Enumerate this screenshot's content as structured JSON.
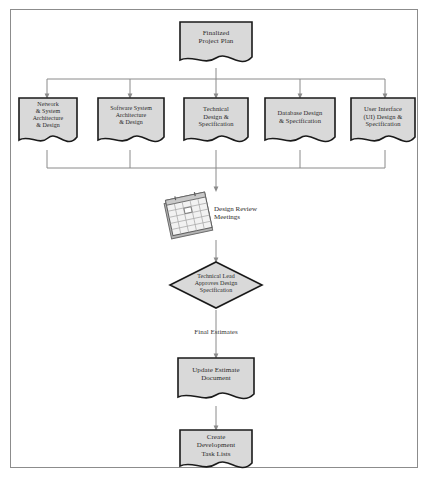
{
  "diagram": {
    "border_color": "#8c8c8c",
    "node_fill": "#d9d9d9",
    "node_stroke": "#1a1a1a",
    "connector_color": "#8a8a8a",
    "background": "#ffffff",
    "start_node": {
      "label": "Finalized\nProject Plan",
      "shape": "document"
    },
    "design_tasks": [
      {
        "label": "Network\n& System\nArchitecture\n& Design",
        "shape": "document"
      },
      {
        "label": "Software System\nArchitecture\n& Design",
        "shape": "document"
      },
      {
        "label": "Technical\nDesign &\nSpecification",
        "shape": "document"
      },
      {
        "label": "Database Design\n& Specification",
        "shape": "document"
      },
      {
        "label": "User Interface\n(UI) Design &\nSpecification",
        "shape": "document"
      }
    ],
    "meeting_node": {
      "label": "Design Review\nMeetings",
      "shape": "calendar"
    },
    "decision_node": {
      "label": "Technical Lead\nApproves Design\nSpecification",
      "shape": "diamond"
    },
    "edge_labels": [
      {
        "label": "Final Estimates"
      }
    ],
    "end_nodes": [
      {
        "label": "Update Estimate\nDocument",
        "shape": "document"
      },
      {
        "label": "Create\nDevelopment\nTask Lists",
        "shape": "document"
      }
    ]
  }
}
